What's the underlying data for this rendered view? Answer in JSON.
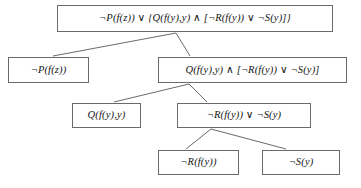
{
  "diagram": {
    "stroke_color": "#6a6a6a",
    "text_color": "#141414",
    "background_color": "#ffffff"
  },
  "nodes": {
    "root": {
      "label": "¬P(f(z)) ∨ {Q(f(y),y) ∧ [¬R(f(y)) ∨ ¬S(y)]}"
    },
    "left1": {
      "label": "¬P(f(z))"
    },
    "right1": {
      "label": "Q(f(y),y) ∧ [¬R(f(y)) ∨ ¬S(y)]"
    },
    "q": {
      "label": "Q(f(y),y)"
    },
    "rs": {
      "label": "¬R(f(y)) ∨ ¬S(y)"
    },
    "notr": {
      "label": "¬R(f(y))"
    },
    "nots": {
      "label": "¬S(y)"
    }
  },
  "edges": [
    {
      "name": "root-to-left1",
      "from": "root",
      "to": "left1"
    },
    {
      "name": "root-to-right1",
      "from": "root",
      "to": "right1"
    },
    {
      "name": "right1-to-q",
      "from": "right1",
      "to": "q"
    },
    {
      "name": "right1-to-rs",
      "from": "right1",
      "to": "rs"
    },
    {
      "name": "rs-to-notr",
      "from": "rs",
      "to": "notr"
    },
    {
      "name": "rs-to-nots",
      "from": "rs",
      "to": "nots"
    }
  ]
}
